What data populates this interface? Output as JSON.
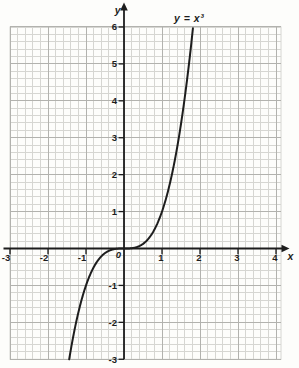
{
  "figure": {
    "equation_label": "y = x³",
    "x_axis_letter": "x",
    "y_axis_letter": "y",
    "origin_label": "0",
    "colors": {
      "paper": "#fdfdfb",
      "minor_grid": "#d6d6d2",
      "major_grid": "#b2b2ae",
      "ink": "#1d1d1d"
    }
  },
  "chart_data": {
    "type": "line",
    "title": "y = x³",
    "xlabel": "x",
    "ylabel": "y",
    "xlim": [
      -3,
      4
    ],
    "ylim": [
      -3,
      6
    ],
    "grid": "graph paper: minor squares of 0.2 units, bold line every 1 unit, grid on",
    "legend_position": "none",
    "x_ticks": [
      -3,
      -2,
      -1,
      0,
      1,
      2,
      3,
      4
    ],
    "y_ticks": [
      -3,
      -2,
      -1,
      0,
      1,
      2,
      3,
      4,
      5,
      6
    ],
    "annotations": [
      {
        "text": "y = x³",
        "near": [
          1.6,
          6.3
        ]
      }
    ],
    "series": [
      {
        "name": "y = x³",
        "function": "y = x^3",
        "power": 3,
        "x_range_drawn": [
          -1.44,
          1.82
        ],
        "x": [
          -1.4,
          -1.2,
          -1.0,
          -0.8,
          -0.6,
          -0.4,
          -0.2,
          0,
          0.2,
          0.4,
          0.6,
          0.8,
          1.0,
          1.2,
          1.4,
          1.6,
          1.8
        ],
        "y": [
          -2.744,
          -1.728,
          -1.0,
          -0.512,
          -0.216,
          -0.064,
          -0.008,
          0,
          0.008,
          0.064,
          0.216,
          0.512,
          1.0,
          1.728,
          2.744,
          4.096,
          5.832
        ]
      }
    ]
  }
}
